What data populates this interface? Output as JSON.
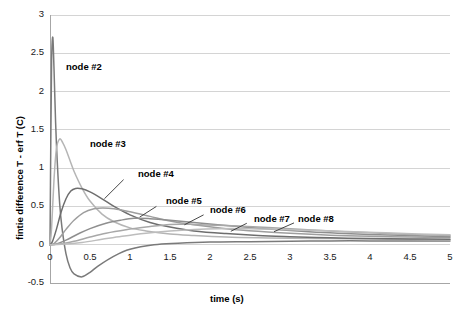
{
  "chart_data": {
    "type": "line",
    "title": "",
    "xlabel": "time (s)",
    "ylabel": "fintie difference T - erf T (C)",
    "xlim": [
      0,
      5
    ],
    "ylim": [
      -0.5,
      3
    ],
    "xticks": [
      "0",
      "0.5",
      "1",
      "1.5",
      "2",
      "2.5",
      "3",
      "3.5",
      "4",
      "4.5",
      "5"
    ],
    "xtick_values": [
      0,
      0.5,
      1,
      1.5,
      2,
      2.5,
      3,
      3.5,
      4,
      4.5,
      5
    ],
    "yticks": [
      "-0.5",
      "0",
      "0.5",
      "1",
      "1.5",
      "2",
      "2.5",
      "3"
    ],
    "ytick_values": [
      -0.5,
      0,
      0.5,
      1,
      1.5,
      2,
      2.5,
      3
    ],
    "grid": "horizontal",
    "legend": "inline-annotations",
    "series": [
      {
        "name": "node #2",
        "color": "#7a7a7a",
        "peak_x": 0.035,
        "peak_y": 2.71,
        "undershoot_y": -0.42,
        "label_x": 0.2,
        "label_y": 2.32,
        "leader": false,
        "x": [
          0,
          0.01,
          0.02,
          0.035,
          0.05,
          0.07,
          0.09,
          0.12,
          0.15,
          0.2,
          0.25,
          0.3,
          0.4,
          0.5,
          0.6,
          0.8,
          1.0,
          1.3,
          1.6,
          2.0,
          2.5,
          3.0,
          3.5,
          4.0,
          4.5,
          5.0
        ],
        "y": [
          0,
          1.35,
          2.4,
          2.71,
          2.3,
          1.6,
          1.1,
          0.55,
          0.22,
          -0.12,
          -0.3,
          -0.38,
          -0.42,
          -0.36,
          -0.28,
          -0.15,
          -0.06,
          0.0,
          0.02,
          0.035,
          0.04,
          0.045,
          0.05,
          0.05,
          0.05,
          0.05
        ]
      },
      {
        "name": "node #3",
        "color": "#b5b5b5",
        "peak_x": 0.12,
        "peak_y": 1.38,
        "label_x": 0.5,
        "label_y": 1.32,
        "leader": false,
        "x": [
          0,
          0.02,
          0.05,
          0.08,
          0.12,
          0.16,
          0.2,
          0.25,
          0.3,
          0.4,
          0.5,
          0.65,
          0.8,
          1.0,
          1.2,
          1.5,
          1.8,
          2.2,
          2.6,
          3.0,
          3.5,
          4.0,
          4.5,
          5.0
        ],
        "y": [
          0,
          0.22,
          0.85,
          1.25,
          1.38,
          1.33,
          1.24,
          1.1,
          0.96,
          0.74,
          0.57,
          0.4,
          0.3,
          0.22,
          0.18,
          0.14,
          0.12,
          0.1,
          0.09,
          0.085,
          0.08,
          0.075,
          0.07,
          0.065
        ]
      },
      {
        "name": "node #4",
        "color": "#6e6e6e",
        "peak_x": 0.32,
        "peak_y": 0.735,
        "label_x": 1.1,
        "label_y": 0.92,
        "leader": true,
        "leader_x1": 0.92,
        "leader_y1": 0.85,
        "leader_x2": 0.68,
        "leader_y2": 0.6,
        "x": [
          0,
          0.03,
          0.08,
          0.14,
          0.2,
          0.26,
          0.32,
          0.4,
          0.5,
          0.65,
          0.8,
          1.0,
          1.25,
          1.5,
          1.8,
          2.2,
          2.6,
          3.0,
          3.5,
          4.0,
          4.5,
          5.0
        ],
        "y": [
          0,
          0.04,
          0.2,
          0.43,
          0.6,
          0.7,
          0.735,
          0.73,
          0.69,
          0.6,
          0.5,
          0.39,
          0.29,
          0.23,
          0.18,
          0.145,
          0.12,
          0.105,
          0.09,
          0.08,
          0.075,
          0.07
        ]
      },
      {
        "name": "node #5",
        "color": "#9e9e9e",
        "peak_x": 0.66,
        "peak_y": 0.48,
        "label_x": 1.45,
        "label_y": 0.565,
        "leader": true,
        "leader_x1": 1.33,
        "leader_y1": 0.5,
        "leader_x2": 1.12,
        "leader_y2": 0.36,
        "x": [
          0,
          0.05,
          0.12,
          0.2,
          0.3,
          0.42,
          0.55,
          0.66,
          0.8,
          1.0,
          1.25,
          1.5,
          1.8,
          2.2,
          2.6,
          3.0,
          3.5,
          4.0,
          4.5,
          5.0
        ],
        "y": [
          0,
          0.015,
          0.09,
          0.2,
          0.32,
          0.42,
          0.47,
          0.48,
          0.47,
          0.43,
          0.37,
          0.31,
          0.26,
          0.21,
          0.175,
          0.15,
          0.125,
          0.11,
          0.1,
          0.09
        ]
      },
      {
        "name": "node #6",
        "color": "#8f8f8f",
        "peak_x": 1.05,
        "peak_y": 0.345,
        "label_x": 2.0,
        "label_y": 0.45,
        "leader": true,
        "leader_x1": 1.92,
        "leader_y1": 0.39,
        "leader_x2": 1.68,
        "leader_y2": 0.26,
        "x": [
          0,
          0.08,
          0.2,
          0.35,
          0.5,
          0.7,
          0.88,
          1.05,
          1.25,
          1.5,
          1.8,
          2.2,
          2.6,
          3.0,
          3.5,
          4.0,
          4.5,
          5.0
        ],
        "y": [
          0,
          0.01,
          0.06,
          0.14,
          0.21,
          0.28,
          0.32,
          0.345,
          0.34,
          0.32,
          0.29,
          0.25,
          0.215,
          0.185,
          0.155,
          0.135,
          0.12,
          0.105
        ]
      },
      {
        "name": "node #7",
        "color": "#a8a8a8",
        "peak_x": 1.5,
        "peak_y": 0.265,
        "label_x": 2.55,
        "label_y": 0.33,
        "leader": true,
        "leader_x1": 2.46,
        "leader_y1": 0.28,
        "leader_x2": 2.26,
        "leader_y2": 0.175,
        "x": [
          0,
          0.12,
          0.3,
          0.5,
          0.7,
          0.95,
          1.2,
          1.5,
          1.8,
          2.2,
          2.6,
          3.0,
          3.5,
          4.0,
          4.5,
          5.0
        ],
        "y": [
          0,
          0.008,
          0.045,
          0.1,
          0.15,
          0.195,
          0.23,
          0.265,
          0.265,
          0.25,
          0.23,
          0.21,
          0.18,
          0.155,
          0.135,
          0.12
        ]
      },
      {
        "name": "node #8",
        "color": "#bdbdbd",
        "peak_x": 2.0,
        "peak_y": 0.21,
        "label_x": 3.1,
        "label_y": 0.335,
        "leader": true,
        "leader_x1": 3.05,
        "leader_y1": 0.285,
        "leader_x2": 2.8,
        "leader_y2": 0.17,
        "x": [
          0,
          0.15,
          0.4,
          0.65,
          0.9,
          1.2,
          1.5,
          1.8,
          2.1,
          2.5,
          2.9,
          3.3,
          3.8,
          4.2,
          4.6,
          5.0
        ],
        "y": [
          0,
          0.005,
          0.03,
          0.07,
          0.11,
          0.15,
          0.18,
          0.2,
          0.21,
          0.21,
          0.2,
          0.19,
          0.17,
          0.155,
          0.14,
          0.13
        ]
      }
    ]
  },
  "axes": {
    "x_title": "time (s)",
    "y_title": "fintie difference T - erf T (C)"
  },
  "colors": {
    "grid": "#d4d4d4",
    "axis": "#a6a6a6",
    "text": "#000000",
    "background": "#ffffff"
  }
}
